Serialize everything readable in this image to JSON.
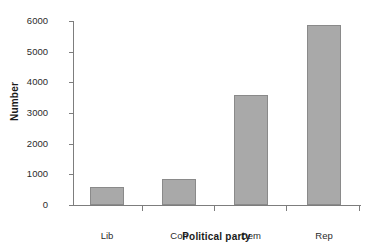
{
  "chart_data": {
    "type": "bar",
    "title": "",
    "categories": [
      "Lib",
      "Con",
      "Dem",
      "Rep"
    ],
    "values": [
      580,
      840,
      3580,
      5870
    ],
    "xlabel": "Political party",
    "ylabel": "Number",
    "ylim": [
      0,
      6000
    ],
    "yticks": [
      0,
      1000,
      2000,
      3000,
      4000,
      5000,
      6000
    ],
    "ytick_labels": [
      "0",
      "1000",
      "2000",
      "3000",
      "4000",
      "5000",
      "6000"
    ],
    "grid": false,
    "legend": null,
    "bar_color": "#a9a9a9",
    "bar_edge_color": "#8a8a8a",
    "axis_color": "#7d7d7d",
    "background": "#ffffff"
  }
}
